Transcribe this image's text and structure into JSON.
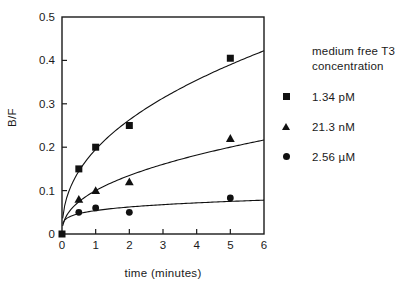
{
  "figure": {
    "background": "#ffffff"
  },
  "chart_data": {
    "type": "scatter",
    "title": "",
    "xlabel": "time (minutes)",
    "ylabel": "B/F",
    "xlim": [
      0,
      6
    ],
    "ylim": [
      0,
      0.5
    ],
    "xticks": [
      0,
      1,
      2,
      3,
      4,
      5,
      6
    ],
    "xtick_labels": [
      "0",
      "1",
      "2",
      "3",
      "4",
      "5",
      "6"
    ],
    "yticks": [
      0,
      0.1,
      0.2,
      0.3,
      0.4,
      0.5
    ],
    "ytick_labels": [
      "0",
      "0.1",
      "0.2",
      "0.3",
      "0.4",
      "0.5"
    ],
    "grid": false,
    "frame": "full-box",
    "axis_color": "#1a1a1a",
    "legend_position": "right-outside",
    "legend_title_lines": [
      "medium free T3",
      "concentration"
    ],
    "series": [
      {
        "name": "1.34 pM",
        "marker": "square",
        "color": "#111111",
        "points": [
          [
            0,
            0
          ],
          [
            0.5,
            0.15
          ],
          [
            1,
            0.2
          ],
          [
            2,
            0.25
          ],
          [
            5,
            0.405
          ]
        ],
        "fit_curve": {
          "model": "power",
          "a": 0.195,
          "b": 0.431
        }
      },
      {
        "name": "21.3 nM",
        "marker": "triangle",
        "color": "#111111",
        "points": [
          [
            0.5,
            0.08
          ],
          [
            1,
            0.1
          ],
          [
            2,
            0.12
          ],
          [
            5,
            0.22
          ]
        ],
        "fit_curve": {
          "model": "power",
          "a": 0.1,
          "b": 0.431
        }
      },
      {
        "name": "2.56 µM",
        "marker": "circle",
        "color": "#111111",
        "points": [
          [
            0.5,
            0.05
          ],
          [
            1,
            0.06
          ],
          [
            2,
            0.05
          ],
          [
            5,
            0.083
          ]
        ],
        "fit_curve": {
          "model": "power",
          "a": 0.054,
          "b": 0.205
        }
      }
    ]
  }
}
